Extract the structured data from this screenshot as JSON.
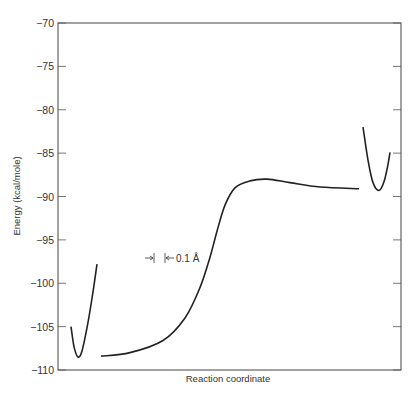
{
  "chart_data": {
    "type": "line",
    "title": "",
    "xlabel": "Reaction coordinate",
    "ylabel": "Energy (kcal/mole)",
    "ylim": [
      -110,
      -70
    ],
    "yticks": [
      -70,
      -75,
      -80,
      -85,
      -90,
      -95,
      -100,
      -105,
      -110
    ],
    "ytick_labels": [
      "−70",
      "−75",
      "−80",
      "−85",
      "−90",
      "−95",
      "−100",
      "−105",
      "−110"
    ],
    "grid": false,
    "legend": null,
    "annotation": "0.1 Å",
    "series": [
      {
        "name": "reactant-well",
        "points": [
          [
            71,
            -105.0
          ],
          [
            74,
            -107.3
          ],
          [
            78,
            -108.5
          ],
          [
            82,
            -107.8
          ],
          [
            88,
            -104.5
          ],
          [
            93,
            -101.0
          ],
          [
            97,
            -97.8
          ]
        ]
      },
      {
        "name": "reaction-path",
        "points": [
          [
            101,
            -108.4
          ],
          [
            130,
            -108.0
          ],
          [
            163,
            -106.6
          ],
          [
            185,
            -104.0
          ],
          [
            200,
            -100.5
          ],
          [
            210,
            -97.0
          ],
          [
            217,
            -94.0
          ],
          [
            225,
            -91.0
          ],
          [
            235,
            -89.0
          ],
          [
            250,
            -88.2
          ],
          [
            267,
            -88.0
          ],
          [
            290,
            -88.4
          ],
          [
            320,
            -88.9
          ],
          [
            359,
            -89.1
          ]
        ]
      },
      {
        "name": "product-well",
        "points": [
          [
            363,
            -82.0
          ],
          [
            368,
            -85.8
          ],
          [
            373,
            -88.4
          ],
          [
            379,
            -89.3
          ],
          [
            384,
            -88.3
          ],
          [
            388,
            -86.3
          ],
          [
            390,
            -84.9
          ]
        ]
      }
    ]
  },
  "axes": {
    "y_label": "Energy (kcal/mole)",
    "x_label": "Reaction coordinate"
  },
  "annotation": {
    "scale_label": "0.1 Å"
  }
}
